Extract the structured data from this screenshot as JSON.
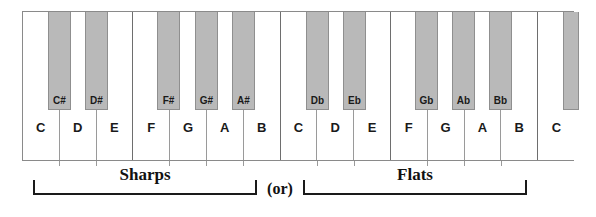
{
  "diagram": {
    "colors": {
      "black_key_fill": "#b9b9b9",
      "white_key_fill": "#ffffff",
      "outline": "#8a8a8a",
      "text": "#1a1a1a"
    }
  },
  "white_keys": [
    {
      "label": "C",
      "octave_edge": false
    },
    {
      "label": "D",
      "octave_edge": false
    },
    {
      "label": "E",
      "octave_edge": true
    },
    {
      "label": "F",
      "octave_edge": false
    },
    {
      "label": "G",
      "octave_edge": false
    },
    {
      "label": "A",
      "octave_edge": false
    },
    {
      "label": "B",
      "octave_edge": true
    },
    {
      "label": "C",
      "octave_edge": false
    },
    {
      "label": "D",
      "octave_edge": false
    },
    {
      "label": "E",
      "octave_edge": true
    },
    {
      "label": "F",
      "octave_edge": false
    },
    {
      "label": "G",
      "octave_edge": false
    },
    {
      "label": "A",
      "octave_edge": false
    },
    {
      "label": "B",
      "octave_edge": true
    },
    {
      "label": "C",
      "octave_edge": false
    }
  ],
  "black_keys": [
    {
      "label": "C#",
      "group": "sharps"
    },
    {
      "label": "D#",
      "group": "sharps"
    },
    {
      "label": "F#",
      "group": "sharps"
    },
    {
      "label": "G#",
      "group": "sharps"
    },
    {
      "label": "A#",
      "group": "sharps"
    },
    {
      "label": "Db",
      "group": "flats"
    },
    {
      "label": "Eb",
      "group": "flats"
    },
    {
      "label": "Gb",
      "group": "flats"
    },
    {
      "label": "Ab",
      "group": "flats"
    },
    {
      "label": "Bb",
      "group": "flats"
    },
    {
      "label": "",
      "group": "partial"
    }
  ],
  "brackets": {
    "sharps_label": "Sharps",
    "or_label": "(or)",
    "flats_label": "Flats"
  }
}
